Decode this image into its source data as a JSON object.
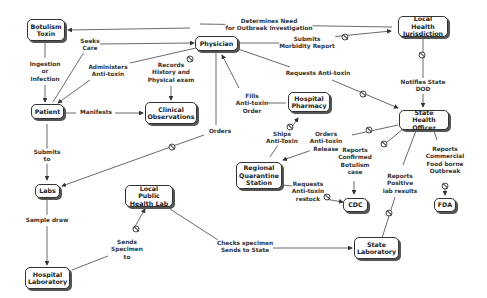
{
  "diagram": {
    "type": "concept-map",
    "nodes": {
      "botulism_toxin": "Botulism\nToxin",
      "physician": "Physician",
      "local_health_jurisdiction": "Local Health\nJurisdiction",
      "patient": "Patient",
      "clinical_observations": "Clinical\nObservations",
      "hospital_pharmacy": "Hospital\nPharmacy",
      "state_health_officer": "State Health\nOfficer",
      "regional_quarantine_station": "Regional\nQuarantine\nStation",
      "labs": "Labs",
      "local_public_health_lab": "Local Public\nHealth Lab",
      "cdc": "CDC",
      "fda": "FDA",
      "state_laboratory": "State\nLaboratory",
      "hospital_laboratory": "Hospital\nLaboratory"
    },
    "edge_labels": {
      "determines_need": "Determines Need\nfor Outbreak Investigation",
      "seeks_care": "Seeks\nCare",
      "submits_morbidity": "Submits\nMorbidity Report",
      "ingestion": "Ingestion\nor\nInfection",
      "administers": "Administers\nAnti-toxin",
      "records_history": "Records\nHistory and\nPhysical exam",
      "requests_antitoxin": "Requests Anti-toxin",
      "notifies_state": "Notifies State\nDOD",
      "manifests": "Manifests",
      "fills_order": "Fills\nAnti-toxin\nOrder",
      "orders_antitoxin_release": "Orders\nAnti-toxin\nRelease",
      "ships_antitoxin": "Ships\nAnti-Toxin",
      "orders": "Orders",
      "submits_to": "Submits\nto",
      "reports_confirmed": "Reports\nConfirmed\nBotulism\ncase",
      "reports_commercial": "Reports\nCommercial\nFood borne\nOutbreak",
      "requests_restock": "Requests\nAnti-toxin\nrestock",
      "reports_positive": "Reports\nPositive\nlab results",
      "sample_draw": "Sample draw",
      "sends_specimen": "Sends\nSpecimen\nto",
      "checks_specimen": "Checks specimen\nSends to State"
    },
    "edges": [
      {
        "from": "local_health_jurisdiction",
        "to": "botulism_toxin",
        "label": "determines_need"
      },
      {
        "from": "patient",
        "to": "physician",
        "label": "seeks_care"
      },
      {
        "from": "physician",
        "to": "local_health_jurisdiction",
        "label": "submits_morbidity"
      },
      {
        "from": "botulism_toxin",
        "to": "patient",
        "label": "ingestion"
      },
      {
        "from": "physician",
        "to": "patient",
        "label": "administers"
      },
      {
        "from": "physician",
        "to": "clinical_observations",
        "label": "records_history"
      },
      {
        "from": "physician",
        "to": "state_health_officer",
        "label": "requests_antitoxin"
      },
      {
        "from": "local_health_jurisdiction",
        "to": "state_health_officer",
        "label": "notifies_state"
      },
      {
        "from": "patient",
        "to": "clinical_observations",
        "label": "manifests"
      },
      {
        "from": "hospital_pharmacy",
        "to": "physician",
        "label": "fills_order"
      },
      {
        "from": "state_health_officer",
        "to": "regional_quarantine_station",
        "label": "orders_antitoxin_release"
      },
      {
        "from": "regional_quarantine_station",
        "to": "hospital_pharmacy",
        "label": "ships_antitoxin"
      },
      {
        "from": "physician",
        "to": "labs",
        "label": "orders"
      },
      {
        "from": "patient",
        "to": "labs",
        "label": "submits_to"
      },
      {
        "from": "state_health_officer",
        "to": "cdc",
        "label": "reports_confirmed"
      },
      {
        "from": "state_health_officer",
        "to": "fda",
        "label": "reports_commercial"
      },
      {
        "from": "regional_quarantine_station",
        "to": "cdc",
        "label": "requests_restock"
      },
      {
        "from": "state_laboratory",
        "to": "state_health_officer",
        "label": "reports_positive"
      },
      {
        "from": "labs",
        "to": "hospital_laboratory",
        "label": "sample_draw"
      },
      {
        "from": "hospital_laboratory",
        "to": "local_public_health_lab",
        "label": "sends_specimen"
      },
      {
        "from": "local_public_health_lab",
        "to": "state_laboratory",
        "label": "checks_specimen"
      }
    ]
  }
}
